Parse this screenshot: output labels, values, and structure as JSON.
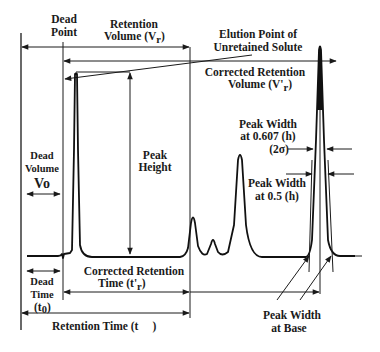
{
  "diagram": {
    "labels": {
      "dead_point": [
        "Dead",
        "Point"
      ],
      "retention_volume": [
        "Retention",
        "Volume (V",
        "r",
        ")"
      ],
      "elution_point": [
        "Elution Point of",
        "Unretained Solute"
      ],
      "corrected_retention_volume": [
        "Corrected Retention",
        "Volume (V'",
        "r",
        ")"
      ],
      "peak_height": [
        "Peak",
        "Height"
      ],
      "dead_volume": [
        "Dead",
        "Volume",
        "Vo"
      ],
      "peak_width_0607": [
        "Peak Width",
        "at 0.607 (h)",
        "(2σ)"
      ],
      "peak_width_05": [
        "Peak Width",
        "at 0.5 (h)"
      ],
      "dead_time": [
        "Dead",
        "Time",
        "(t",
        "0",
        ")"
      ],
      "corrected_retention_time": [
        "Corrected Retention",
        "Time (t'",
        "r",
        ")"
      ],
      "retention_time": [
        "Retention Time (t",
        ")"
      ],
      "peak_width_base": [
        "Peak Width",
        "at Base"
      ]
    },
    "peaks": [
      {
        "name": "unretained-solute-peak",
        "relative_height": 1.0
      },
      {
        "name": "minor-peak-1",
        "relative_height": 0.22
      },
      {
        "name": "minor-peak-2",
        "relative_height": 0.1
      },
      {
        "name": "peak-3",
        "relative_height": 0.55
      },
      {
        "name": "analyte-peak",
        "relative_height": 1.0
      }
    ],
    "colors": {
      "ink": "#1a1a1a",
      "background": "#ffffff"
    }
  }
}
